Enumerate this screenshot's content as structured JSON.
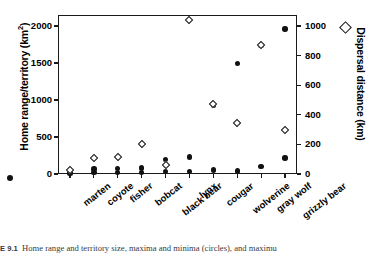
{
  "chart_data": {
    "type": "scatter",
    "title": "",
    "categories": [
      "marten",
      "coyote",
      "fisher",
      "bobcat",
      "black bear",
      "lynx",
      "cougar",
      "wolverine",
      "gray wolf",
      "grizzly bear"
    ],
    "xlabel": "",
    "ylabel": "Home range/territory (km2)",
    "ylabel_unit_sup": "2",
    "ylabel_base": "Home range/territory (km",
    "ylabel_tail": ")",
    "y2label": "Dispersal distance (km)",
    "ylim": [
      0,
      2150
    ],
    "y2lim": [
      0,
      1075
    ],
    "yticks": [
      0,
      500,
      1000,
      1500,
      2000
    ],
    "y2ticks": [
      0,
      200,
      400,
      600,
      800,
      1000
    ],
    "grid": false,
    "legend_position": "outside-axis-markers",
    "series": [
      {
        "name": "Home range/territory maxima (circles)",
        "marker": "filled-circle",
        "axis": "left",
        "values": [
          25,
          70,
          75,
          80,
          195,
          230,
          930,
          1490,
          1740,
          1960
        ]
      },
      {
        "name": "Home range/territory minima (circles)",
        "marker": "filled-circle",
        "axis": "left",
        "values": [
          8,
          18,
          20,
          22,
          30,
          32,
          52,
          40,
          100,
          215
        ]
      },
      {
        "name": "Maximum dispersal distance (diamonds)",
        "marker": "open-diamond",
        "axis": "right",
        "values": [
          25,
          108,
          118,
          200,
          60,
          1040,
          470,
          345,
          870,
          300
        ]
      }
    ]
  },
  "axes": {
    "left": {
      "title_base": "Home range/territory (km",
      "title_sup": "2",
      "title_tail": ")",
      "ticks": [
        "2000",
        "1500",
        "1000",
        "500",
        "0"
      ]
    },
    "right": {
      "title": "Dispersal distance (km)",
      "ticks": [
        "1000",
        "800",
        "600",
        "400",
        "200",
        "0"
      ]
    },
    "bottom": {
      "ticks": [
        "marten",
        "coyote",
        "fisher",
        "bobcat",
        "black bear",
        "lynx",
        "cougar",
        "wolverine",
        "gray wolf",
        "grizzly bear"
      ]
    }
  },
  "legend": {
    "circle_marker": "filled-circle-icon",
    "diamond_marker": "open-diamond-icon"
  },
  "caption": {
    "number": "E 9.1",
    "text": "Home range and territory size, maxima and minima (circles), and maximu"
  }
}
